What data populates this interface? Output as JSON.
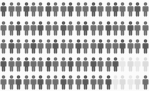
{
  "chart_data": {
    "type": "pictogram",
    "title": "",
    "subtitle": "",
    "xlabel": "",
    "ylabel": "",
    "icon": "person-icon",
    "icon_label": "person",
    "unit_value": 1,
    "columns": 20,
    "rows": 5,
    "total_icons": 100,
    "filled_count": 91,
    "empty_count": 9,
    "legend": [],
    "annotations": [],
    "grid": false,
    "colors": {
      "filled": "#6f6f6f",
      "filled_dark": "#5a5a5a",
      "empty": "#dcdcdc",
      "empty_light": "#e8e8e8",
      "background": "#fbfbfb"
    },
    "series": [
      {
        "name": "filled",
        "values": [
          20,
          20,
          20,
          16,
          15
        ]
      },
      {
        "name": "empty",
        "values": [
          0,
          0,
          0,
          4,
          5
        ]
      }
    ],
    "row_states": [
      [
        "f",
        "f",
        "f",
        "f",
        "f",
        "f",
        "f",
        "f",
        "f",
        "f",
        "f",
        "f",
        "f",
        "f",
        "f",
        "f",
        "f",
        "f",
        "f",
        "f"
      ],
      [
        "f",
        "f",
        "f",
        "f",
        "f",
        "f",
        "f",
        "f",
        "f",
        "f",
        "f",
        "f",
        "f",
        "f",
        "f",
        "f",
        "f",
        "f",
        "f",
        "f"
      ],
      [
        "f",
        "f",
        "f",
        "f",
        "f",
        "f",
        "f",
        "f",
        "f",
        "f",
        "f",
        "f",
        "f",
        "f",
        "f",
        "f",
        "f",
        "f",
        "f",
        "f"
      ],
      [
        "f",
        "f",
        "f",
        "f",
        "f",
        "f",
        "f",
        "f",
        "f",
        "f",
        "f",
        "f",
        "f",
        "f",
        "f",
        "f",
        "e",
        "e",
        "e",
        "e"
      ],
      [
        "f",
        "f",
        "f",
        "f",
        "f",
        "f",
        "f",
        "f",
        "f",
        "f",
        "f",
        "f",
        "f",
        "f",
        "f",
        "e",
        "e",
        "e",
        "e",
        "f"
      ]
    ]
  }
}
